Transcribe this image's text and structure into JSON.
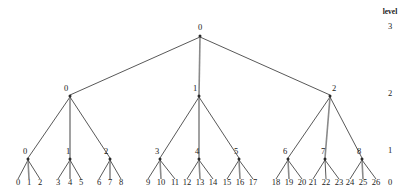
{
  "figure": {
    "title": "",
    "kind": "tree-diagram",
    "width": 414,
    "height": 196,
    "background": "#ffffff",
    "line_color": "#3a3a3a",
    "highlight_line_color": "#8a8a8a",
    "text_color": "#1a1a1a"
  },
  "axis": {
    "title": "level",
    "ticks": [
      {
        "label": "3",
        "x": 390,
        "y": 29
      },
      {
        "label": "2",
        "x": 390,
        "y": 96
      },
      {
        "label": "1",
        "x": 390,
        "y": 153
      },
      {
        "label": "0",
        "x": 390,
        "y": 185
      }
    ],
    "title_x": 390,
    "title_y": 14
  },
  "chart_data": {
    "type": "tree",
    "title": "",
    "levels": [
      3,
      2,
      1,
      0
    ],
    "level_label": "level",
    "branching_factor": 3,
    "depth": 3,
    "nodes": [
      {
        "id": "r",
        "label": "0",
        "level": 3,
        "x": 200,
        "y": 36,
        "label_x": 200,
        "label_y": 30
      },
      {
        "id": "n0",
        "label": "0",
        "level": 2,
        "x": 70,
        "y": 96,
        "label_x": 66,
        "label_y": 91
      },
      {
        "id": "n1",
        "label": "1",
        "level": 2,
        "x": 199,
        "y": 96,
        "label_x": 195,
        "label_y": 91
      },
      {
        "id": "n2",
        "label": "2",
        "level": 2,
        "x": 330,
        "y": 96,
        "label_x": 334,
        "label_y": 91
      },
      {
        "id": "m0",
        "label": "0",
        "level": 1,
        "x": 28,
        "y": 159,
        "label_x": 25,
        "label_y": 154
      },
      {
        "id": "m1",
        "label": "1",
        "level": 1,
        "x": 70,
        "y": 159,
        "label_x": 68,
        "label_y": 154
      },
      {
        "id": "m2",
        "label": "2",
        "level": 1,
        "x": 110,
        "y": 159,
        "label_x": 106,
        "label_y": 154
      },
      {
        "id": "m3",
        "label": "3",
        "level": 1,
        "x": 160,
        "y": 159,
        "label_x": 157,
        "label_y": 154
      },
      {
        "id": "m4",
        "label": "4",
        "level": 1,
        "x": 199,
        "y": 159,
        "label_x": 197,
        "label_y": 154
      },
      {
        "id": "m5",
        "label": "5",
        "level": 1,
        "x": 239,
        "y": 159,
        "label_x": 236,
        "label_y": 154
      },
      {
        "id": "m6",
        "label": "6",
        "level": 1,
        "x": 288,
        "y": 159,
        "label_x": 285,
        "label_y": 154
      },
      {
        "id": "m7",
        "label": "7",
        "level": 1,
        "x": 325,
        "y": 159,
        "label_x": 323,
        "label_y": 154
      },
      {
        "id": "m8",
        "label": "8",
        "level": 1,
        "x": 362,
        "y": 159,
        "label_x": 359,
        "label_y": 154
      }
    ],
    "leaves": [
      {
        "label": "0",
        "x": 18,
        "y": 185,
        "parent": "m0"
      },
      {
        "label": "1",
        "x": 29,
        "y": 185,
        "parent": "m0"
      },
      {
        "label": "2",
        "x": 40,
        "y": 185,
        "parent": "m0"
      },
      {
        "label": "3",
        "x": 58,
        "y": 185,
        "parent": "m1"
      },
      {
        "label": "4",
        "x": 70,
        "y": 185,
        "parent": "m1"
      },
      {
        "label": "5",
        "x": 81,
        "y": 185,
        "parent": "m1"
      },
      {
        "label": "6",
        "x": 99,
        "y": 185,
        "parent": "m2"
      },
      {
        "label": "7",
        "x": 110,
        "y": 185,
        "parent": "m2"
      },
      {
        "label": "8",
        "x": 121,
        "y": 185,
        "parent": "m2"
      },
      {
        "label": "9",
        "x": 148,
        "y": 185,
        "parent": "m3"
      },
      {
        "label": "10",
        "x": 161,
        "y": 185,
        "parent": "m3"
      },
      {
        "label": "11",
        "x": 175,
        "y": 185,
        "parent": "m3"
      },
      {
        "label": "12",
        "x": 187,
        "y": 185,
        "parent": "m4"
      },
      {
        "label": "13",
        "x": 200,
        "y": 185,
        "parent": "m4"
      },
      {
        "label": "14",
        "x": 213,
        "y": 185,
        "parent": "m4"
      },
      {
        "label": "15",
        "x": 227,
        "y": 185,
        "parent": "m5"
      },
      {
        "label": "16",
        "x": 240,
        "y": 185,
        "parent": "m5"
      },
      {
        "label": "17",
        "x": 253,
        "y": 185,
        "parent": "m5"
      },
      {
        "label": "18",
        "x": 276,
        "y": 185,
        "parent": "m6"
      },
      {
        "label": "19",
        "x": 289,
        "y": 185,
        "parent": "m6"
      },
      {
        "label": "20",
        "x": 302,
        "y": 185,
        "parent": "m6"
      },
      {
        "label": "21",
        "x": 313,
        "y": 185,
        "parent": "m7"
      },
      {
        "label": "22",
        "x": 326,
        "y": 185,
        "parent": "m7"
      },
      {
        "label": "23",
        "x": 339,
        "y": 185,
        "parent": "m7"
      },
      {
        "label": "24",
        "x": 350,
        "y": 185,
        "parent": "m8"
      },
      {
        "label": "25",
        "x": 363,
        "y": 185,
        "parent": "m8"
      },
      {
        "label": "26",
        "x": 376,
        "y": 185,
        "parent": "m8"
      }
    ],
    "edges": [
      {
        "from": "r",
        "to": "n0",
        "x1": 200,
        "y1": 37,
        "x2": 70,
        "y2": 95,
        "kind": "normal"
      },
      {
        "from": "r",
        "to": "n1",
        "x1": 200,
        "y1": 37,
        "x2": 199,
        "y2": 95,
        "kind": "highlight"
      },
      {
        "from": "r",
        "to": "n2",
        "x1": 200,
        "y1": 37,
        "x2": 330,
        "y2": 95,
        "kind": "normal"
      },
      {
        "from": "n0",
        "to": "m0",
        "x1": 70,
        "y1": 97,
        "x2": 28,
        "y2": 158,
        "kind": "normal"
      },
      {
        "from": "n0",
        "to": "m1",
        "x1": 70,
        "y1": 97,
        "x2": 70,
        "y2": 158,
        "kind": "highlight"
      },
      {
        "from": "n0",
        "to": "m2",
        "x1": 70,
        "y1": 97,
        "x2": 110,
        "y2": 158,
        "kind": "normal"
      },
      {
        "from": "n1",
        "to": "m3",
        "x1": 199,
        "y1": 97,
        "x2": 160,
        "y2": 158,
        "kind": "normal"
      },
      {
        "from": "n1",
        "to": "m4",
        "x1": 199,
        "y1": 97,
        "x2": 199,
        "y2": 158,
        "kind": "highlight"
      },
      {
        "from": "n1",
        "to": "m5",
        "x1": 199,
        "y1": 97,
        "x2": 239,
        "y2": 158,
        "kind": "normal"
      },
      {
        "from": "n2",
        "to": "m6",
        "x1": 330,
        "y1": 97,
        "x2": 288,
        "y2": 158,
        "kind": "normal"
      },
      {
        "from": "n2",
        "to": "m7",
        "x1": 330,
        "y1": 97,
        "x2": 325,
        "y2": 158,
        "kind": "highlight"
      },
      {
        "from": "n2",
        "to": "m8",
        "x1": 330,
        "y1": 97,
        "x2": 362,
        "y2": 158,
        "kind": "normal"
      },
      {
        "from": "m0",
        "to": "l0",
        "x1": 28,
        "y1": 160,
        "x2": 18,
        "y2": 179,
        "kind": "normal"
      },
      {
        "from": "m0",
        "to": "l1",
        "x1": 28,
        "y1": 160,
        "x2": 29,
        "y2": 179,
        "kind": "highlight"
      },
      {
        "from": "m0",
        "to": "l2",
        "x1": 28,
        "y1": 160,
        "x2": 40,
        "y2": 179,
        "kind": "normal"
      },
      {
        "from": "m1",
        "to": "l3",
        "x1": 70,
        "y1": 160,
        "x2": 58,
        "y2": 179,
        "kind": "normal"
      },
      {
        "from": "m1",
        "to": "l4",
        "x1": 70,
        "y1": 160,
        "x2": 70,
        "y2": 179,
        "kind": "highlight"
      },
      {
        "from": "m1",
        "to": "l5",
        "x1": 70,
        "y1": 160,
        "x2": 81,
        "y2": 179,
        "kind": "normal"
      },
      {
        "from": "m2",
        "to": "l6",
        "x1": 110,
        "y1": 160,
        "x2": 99,
        "y2": 179,
        "kind": "normal"
      },
      {
        "from": "m2",
        "to": "l7",
        "x1": 110,
        "y1": 160,
        "x2": 110,
        "y2": 179,
        "kind": "highlight"
      },
      {
        "from": "m2",
        "to": "l8",
        "x1": 110,
        "y1": 160,
        "x2": 121,
        "y2": 179,
        "kind": "normal"
      },
      {
        "from": "m3",
        "to": "l9",
        "x1": 160,
        "y1": 160,
        "x2": 148,
        "y2": 179,
        "kind": "normal"
      },
      {
        "from": "m3",
        "to": "l10",
        "x1": 160,
        "y1": 160,
        "x2": 161,
        "y2": 179,
        "kind": "highlight"
      },
      {
        "from": "m3",
        "to": "l11",
        "x1": 160,
        "y1": 160,
        "x2": 175,
        "y2": 179,
        "kind": "normal"
      },
      {
        "from": "m4",
        "to": "l12",
        "x1": 199,
        "y1": 160,
        "x2": 187,
        "y2": 179,
        "kind": "normal"
      },
      {
        "from": "m4",
        "to": "l13",
        "x1": 199,
        "y1": 160,
        "x2": 200,
        "y2": 179,
        "kind": "highlight"
      },
      {
        "from": "m4",
        "to": "l14",
        "x1": 199,
        "y1": 160,
        "x2": 213,
        "y2": 179,
        "kind": "normal"
      },
      {
        "from": "m5",
        "to": "l15",
        "x1": 239,
        "y1": 160,
        "x2": 227,
        "y2": 179,
        "kind": "normal"
      },
      {
        "from": "m5",
        "to": "l16",
        "x1": 239,
        "y1": 160,
        "x2": 240,
        "y2": 179,
        "kind": "highlight"
      },
      {
        "from": "m5",
        "to": "l17",
        "x1": 239,
        "y1": 160,
        "x2": 253,
        "y2": 179,
        "kind": "normal"
      },
      {
        "from": "m6",
        "to": "l18",
        "x1": 288,
        "y1": 160,
        "x2": 276,
        "y2": 179,
        "kind": "normal"
      },
      {
        "from": "m6",
        "to": "l19",
        "x1": 288,
        "y1": 160,
        "x2": 289,
        "y2": 179,
        "kind": "highlight"
      },
      {
        "from": "m6",
        "to": "l20",
        "x1": 288,
        "y1": 160,
        "x2": 302,
        "y2": 179,
        "kind": "normal"
      },
      {
        "from": "m7",
        "to": "l21",
        "x1": 325,
        "y1": 160,
        "x2": 313,
        "y2": 179,
        "kind": "normal"
      },
      {
        "from": "m7",
        "to": "l22",
        "x1": 325,
        "y1": 160,
        "x2": 326,
        "y2": 179,
        "kind": "normal"
      },
      {
        "from": "m7",
        "to": "l23",
        "x1": 325,
        "y1": 160,
        "x2": 339,
        "y2": 179,
        "kind": "normal"
      },
      {
        "from": "m8",
        "to": "l24",
        "x1": 362,
        "y1": 160,
        "x2": 350,
        "y2": 179,
        "kind": "normal"
      },
      {
        "from": "m8",
        "to": "l25",
        "x1": 362,
        "y1": 160,
        "x2": 363,
        "y2": 179,
        "kind": "highlight"
      },
      {
        "from": "m8",
        "to": "l26",
        "x1": 362,
        "y1": 160,
        "x2": 376,
        "y2": 179,
        "kind": "normal"
      }
    ]
  }
}
